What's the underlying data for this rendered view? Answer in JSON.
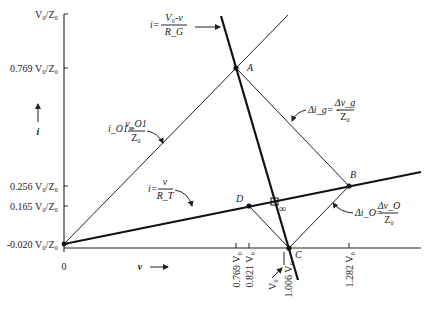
{
  "axes": {
    "y_label": "i",
    "x_label": "v",
    "x_origin_label": "0",
    "y_ticks": [
      {
        "label": "V₀/Z₀",
        "y": 14
      },
      {
        "label": "0.769 V₀/Z₀",
        "y": 68
      },
      {
        "label": "0.256 V₀/Z₀",
        "y": 186
      },
      {
        "label": "0.165 V₀/Z₀",
        "y": 206
      },
      {
        "label": "-0.020 V₀/Z₀",
        "y": 244
      }
    ],
    "x_ticks": [
      {
        "label": "0.769 V₀",
        "x": 236
      },
      {
        "label": "0.821 V₀",
        "x": 249
      },
      {
        "label": "1.006 V₀",
        "x": 289
      },
      {
        "label": "1.282 V₀",
        "x": 349
      }
    ],
    "v0_marker_label": "V₀"
  },
  "points": [
    {
      "name": "A",
      "x": 236,
      "y": 68
    },
    {
      "name": "B",
      "x": 349,
      "y": 186
    },
    {
      "name": "C",
      "x": 289,
      "y": 248
    },
    {
      "name": "D",
      "x": 249,
      "y": 206
    }
  ],
  "convergence_label": "∞",
  "equations": {
    "generator_line": {
      "lhs": "i=",
      "num": "V₀-v",
      "den": "R_G"
    },
    "load_line": {
      "lhs": "i=",
      "num": "v",
      "den": "R_T"
    },
    "io1_line": {
      "lhs": "i_O1=",
      "num": "v_O1",
      "den": "Z₀"
    },
    "delta_ig": {
      "lhs": "Δi_g= -",
      "num": "Δv_g",
      "den": "Z₀"
    },
    "delta_io": {
      "lhs": "Δi_O=",
      "num": "Δv_O",
      "den": "Z₀"
    }
  },
  "colors": {
    "ink": "#111111",
    "background": "#ffffff"
  }
}
